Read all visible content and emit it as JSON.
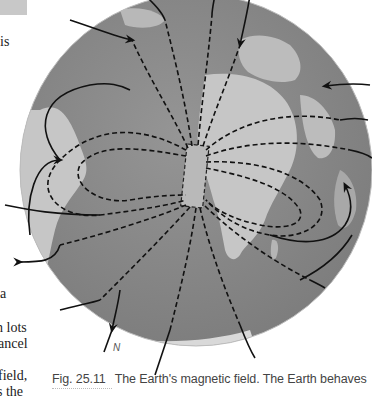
{
  "page": {
    "left_column_fragments": [
      "is",
      "a",
      "n lots",
      "ancel",
      "field,",
      "s the"
    ]
  },
  "figure": {
    "label": "Fig. 25.11",
    "caption": "The Earth's magnetic field. The Earth behaves",
    "pole_label": "N",
    "icons": [
      "globe-icon",
      "bar-magnet-icon",
      "field-line-arrow-icon"
    ],
    "colors": {
      "ocean": "#8a8a8a",
      "land": "#c9c9c9",
      "field_lines": "#111111",
      "text": "#222222"
    }
  }
}
